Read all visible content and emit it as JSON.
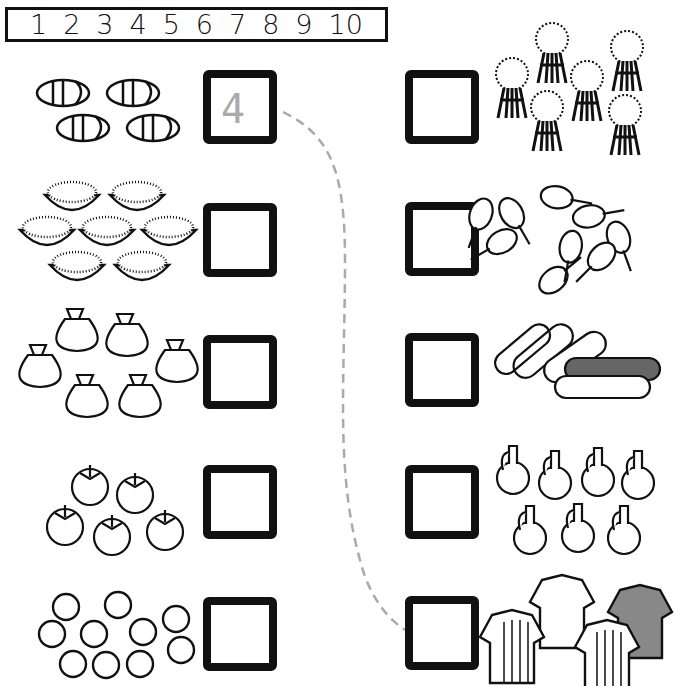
{
  "worksheet": {
    "number_line": [
      "1",
      "2",
      "3",
      "4",
      "5",
      "6",
      "7",
      "8",
      "9",
      "10"
    ],
    "left_column": [
      {
        "item": "sandals",
        "count": 4,
        "answer": "4",
        "traced": true
      },
      {
        "item": "bowls-of-grain",
        "count": 7,
        "answer": "",
        "traced": false
      },
      {
        "item": "sacks",
        "count": 6,
        "answer": "",
        "traced": false
      },
      {
        "item": "tomatoes",
        "count": 5,
        "answer": "",
        "traced": false
      },
      {
        "item": "coins",
        "count": 10,
        "answer": "",
        "traced": false
      }
    ],
    "right_column": [
      {
        "item": "wheat-bundles",
        "count": 6,
        "answer": ""
      },
      {
        "item": "chicken-drumsticks",
        "count": 9,
        "answer": ""
      },
      {
        "item": "cloth-rolls",
        "count": 5,
        "answer": ""
      },
      {
        "item": "jugs",
        "count": 7,
        "answer": ""
      },
      {
        "item": "shirts",
        "count": 4,
        "answer": ""
      }
    ],
    "example_match": {
      "from": "sandals",
      "to": "shirts",
      "value": "4"
    },
    "colors": {
      "ink": "#111111",
      "trace": "#aaaaaa"
    }
  }
}
